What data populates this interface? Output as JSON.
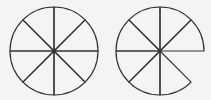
{
  "figure": {
    "background": "#f4f4f4",
    "stroke_color": "#333333",
    "stroke_width": 1.2,
    "shapes": [
      {
        "name": "full-circle",
        "cx": 54,
        "cy": 51,
        "r": 44,
        "sectors": 8,
        "missing_sectors": []
      },
      {
        "name": "circle-missing-one-eighth",
        "cx": 160,
        "cy": 51,
        "r": 44,
        "sectors": 8,
        "missing_sectors": [
          7
        ]
      }
    ]
  }
}
